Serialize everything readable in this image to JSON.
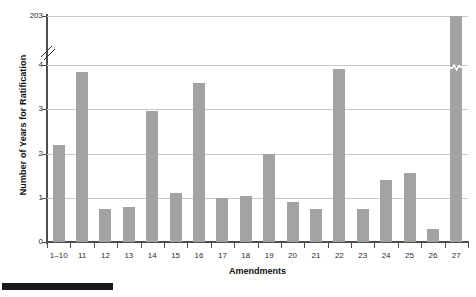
{
  "chart_data": {
    "type": "bar",
    "title": "",
    "xlabel": "Amendments",
    "ylabel": "Number of Years for Ratification",
    "categories": [
      "1–10",
      "11",
      "12",
      "13",
      "14",
      "15",
      "16",
      "17",
      "18",
      "19",
      "20",
      "21",
      "22",
      "23",
      "24",
      "25",
      "26",
      "27"
    ],
    "values": [
      2.2,
      3.85,
      0.75,
      0.8,
      2.95,
      1.1,
      3.6,
      1.0,
      1.05,
      2.0,
      0.9,
      0.75,
      3.9,
      0.75,
      1.4,
      1.55,
      0.3,
      203
    ],
    "ylim": [
      0,
      4
    ],
    "ytick_labels": [
      "0",
      "1",
      "2",
      "3",
      "4",
      "203"
    ],
    "ytick_values": [
      0,
      1,
      2,
      3,
      4,
      203
    ],
    "axis_break": true,
    "axis_break_note": "y-axis broken between 4 and 203",
    "grid": "horizontal",
    "legend": "none",
    "bar_color": "#a3a3a3",
    "grid_color": "#c9c9c9",
    "axis_color": "#4d4d4d"
  },
  "axes": {
    "y_title": "Number of Years for Ratification",
    "x_title": "Amendments"
  }
}
